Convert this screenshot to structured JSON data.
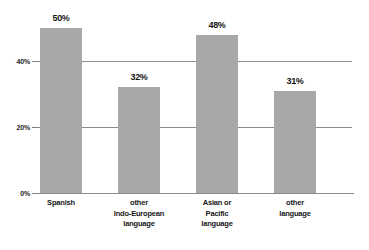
{
  "chart_data": {
    "type": "bar",
    "title": "",
    "subtitle": "",
    "xlabel": "",
    "ylabel": "",
    "categories": [
      "Spanish",
      "other Indo-European language",
      "Asian or Pacific language",
      "other language"
    ],
    "category_lines": [
      [
        "Spanish"
      ],
      [
        "other",
        "Indo-European",
        "language"
      ],
      [
        "Asian or",
        "Pacific",
        "language"
      ],
      [
        "other",
        "language"
      ]
    ],
    "values": [
      50,
      32,
      48,
      31
    ],
    "value_labels": [
      "50%",
      "32%",
      "48%",
      "31%"
    ],
    "ylim": [
      0,
      56
    ],
    "yticks": [
      0,
      20,
      40
    ],
    "ytick_labels": [
      "0%",
      "20%",
      "40%"
    ],
    "grid": true,
    "grid_axis": "y",
    "legend": "none",
    "bar_color": "#a8a8a8",
    "gridline_color": "#8e8e8e",
    "axis_color": "#8c8c8c",
    "text_color": "#161616",
    "background": "#ffffff"
  }
}
